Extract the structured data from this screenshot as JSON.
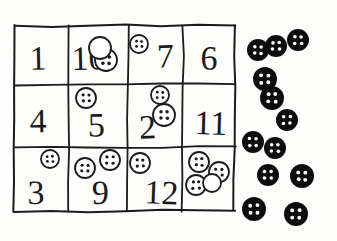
{
  "worksheet": {
    "title": "Number grid with buttons",
    "background_color": "#fdfdfb",
    "ink_color": "#1a1a1a",
    "white_button_fill": "#ffffff",
    "black_button_fill": "#111111",
    "black_button_hole_color": "#ffffff"
  },
  "grid": {
    "rows": 3,
    "columns": 4,
    "left": 15,
    "top": 26,
    "right": 235,
    "bottom": 212,
    "column_dividers": [
      69,
      128,
      183
    ],
    "row_dividers": [
      85,
      148
    ],
    "cells": [
      {
        "row": 1,
        "column": 1,
        "number": "1",
        "buttons_on_number": 0
      },
      {
        "row": 1,
        "column": 2,
        "number": "10",
        "buttons_on_number": 1
      },
      {
        "row": 1,
        "column": 3,
        "number": "7",
        "buttons_on_number": 1
      },
      {
        "row": 1,
        "column": 4,
        "number": "6",
        "buttons_on_number": 0
      },
      {
        "row": 2,
        "column": 1,
        "number": "4",
        "buttons_on_number": 0
      },
      {
        "row": 2,
        "column": 2,
        "number": "5",
        "buttons_on_number": 1
      },
      {
        "row": 2,
        "column": 3,
        "number": "2",
        "buttons_on_number": 2
      },
      {
        "row": 2,
        "column": 4,
        "number": "11",
        "buttons_on_number": 0
      },
      {
        "row": 3,
        "column": 1,
        "number": "3",
        "buttons_on_number": 1
      },
      {
        "row": 3,
        "column": 2,
        "number": "9",
        "buttons_on_number": 2
      },
      {
        "row": 3,
        "column": 3,
        "number": "12",
        "buttons_on_number": 1
      },
      {
        "row": 3,
        "column": 4,
        "number": "",
        "buttons_on_number": 4
      }
    ]
  },
  "white_buttons": [
    {
      "cx": 106,
      "cy": 60,
      "r": 11,
      "holes": 4,
      "label": "white-button-cell-10"
    },
    {
      "cx": 100,
      "cy": 48,
      "r": 11,
      "holes": 0,
      "label": "white-button-plain-cell-10"
    },
    {
      "cx": 139,
      "cy": 44,
      "r": 9,
      "holes": 4,
      "label": "white-button-cell-7"
    },
    {
      "cx": 86,
      "cy": 98,
      "r": 10,
      "holes": 4,
      "label": "white-button-cell-5"
    },
    {
      "cx": 160,
      "cy": 95,
      "r": 9,
      "holes": 4,
      "label": "white-button-cell-2-upper"
    },
    {
      "cx": 164,
      "cy": 115,
      "r": 11,
      "holes": 4,
      "label": "white-button-cell-2-lower"
    },
    {
      "cx": 50,
      "cy": 159,
      "r": 9,
      "holes": 4,
      "label": "white-button-cell-3"
    },
    {
      "cx": 85,
      "cy": 168,
      "r": 10,
      "holes": 4,
      "label": "white-button-cell-9-left"
    },
    {
      "cx": 110,
      "cy": 160,
      "r": 10,
      "holes": 4,
      "label": "white-button-cell-9-right"
    },
    {
      "cx": 140,
      "cy": 163,
      "r": 10,
      "holes": 4,
      "label": "white-button-cell-12"
    },
    {
      "cx": 199,
      "cy": 162,
      "r": 10,
      "holes": 4,
      "label": "white-button-cluster-a"
    },
    {
      "cx": 219,
      "cy": 172,
      "r": 10,
      "holes": 4,
      "label": "white-button-cluster-b"
    },
    {
      "cx": 196,
      "cy": 185,
      "r": 10,
      "holes": 4,
      "label": "white-button-cluster-c"
    },
    {
      "cx": 212,
      "cy": 183,
      "r": 9,
      "holes": 0,
      "label": "white-button-cluster-d"
    }
  ],
  "loose_black_buttons": {
    "count": 12,
    "items": [
      {
        "cx": 258,
        "cy": 50,
        "r": 11
      },
      {
        "cx": 276,
        "cy": 46,
        "r": 11
      },
      {
        "cx": 298,
        "cy": 40,
        "r": 11
      },
      {
        "cx": 265,
        "cy": 79,
        "r": 12
      },
      {
        "cx": 272,
        "cy": 98,
        "r": 12
      },
      {
        "cx": 287,
        "cy": 120,
        "r": 11
      },
      {
        "cx": 253,
        "cy": 142,
        "r": 11
      },
      {
        "cx": 275,
        "cy": 148,
        "r": 11
      },
      {
        "cx": 268,
        "cy": 175,
        "r": 11
      },
      {
        "cx": 302,
        "cy": 176,
        "r": 12
      },
      {
        "cx": 254,
        "cy": 209,
        "r": 12
      },
      {
        "cx": 296,
        "cy": 214,
        "r": 12
      }
    ]
  }
}
